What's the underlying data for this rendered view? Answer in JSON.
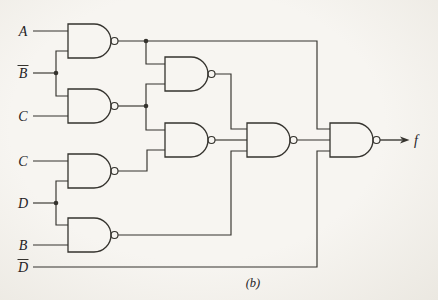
{
  "circuit": {
    "description": "Seven-input NAND-gate logic network realizing output f",
    "caption": {
      "text": "(b)",
      "x": 253,
      "y": 287
    },
    "output": {
      "label": "f",
      "label_x": 414,
      "label_y": 144.5
    },
    "style": {
      "background": "#f5f3ef",
      "line_color": "#35332e",
      "text_color": "#24221f",
      "line_width": 1.15
    },
    "inputs": [
      {
        "label": "A",
        "bar": false,
        "y": 31
      },
      {
        "label": "B",
        "bar": true,
        "y": 73
      },
      {
        "label": "C",
        "bar": false,
        "y": 116
      },
      {
        "label": "C",
        "bar": false,
        "y": 161
      },
      {
        "label": "D",
        "bar": false,
        "y": 203
      },
      {
        "label": "B",
        "bar": false,
        "y": 245
      },
      {
        "label": "D",
        "bar": true,
        "y": 267
      }
    ],
    "gates": [
      {
        "name": "nand-gate-1",
        "type": "NAND-2",
        "x": 68,
        "cy": 41,
        "sources": [
          "A",
          "B-bar"
        ]
      },
      {
        "name": "nand-gate-2",
        "type": "NAND-2",
        "x": 68,
        "cy": 106,
        "sources": [
          "B-bar",
          "C"
        ]
      },
      {
        "name": "nand-gate-3",
        "type": "NAND-2",
        "x": 68,
        "cy": 171,
        "sources": [
          "C",
          "D"
        ]
      },
      {
        "name": "nand-gate-4",
        "type": "NAND-2",
        "x": 68,
        "cy": 235,
        "sources": [
          "D",
          "B"
        ]
      },
      {
        "name": "nand-gate-5",
        "type": "NAND-2",
        "x": 165,
        "cy": 74,
        "sources": [
          "gate-1-out",
          "gate-2-out"
        ]
      },
      {
        "name": "nand-gate-6",
        "type": "NAND-2",
        "x": 165,
        "cy": 140,
        "sources": [
          "gate-2-out",
          "gate-3-out"
        ]
      },
      {
        "name": "nand-gate-7",
        "type": "NAND-3",
        "x": 247,
        "cy": 140,
        "sources": [
          "gate-5-out",
          "gate-6-out",
          "gate-4-out"
        ]
      },
      {
        "name": "nand-gate-8",
        "type": "NAND-3",
        "x": 330,
        "cy": 140,
        "sources": [
          "gate-1-out",
          "gate-7-out",
          "D-bar"
        ],
        "drives": "f"
      }
    ],
    "wires": [
      {
        "name": "input-a",
        "pts": [
          [
            33,
            31
          ],
          [
            68,
            31
          ]
        ]
      },
      {
        "name": "input-bbar-stem",
        "pts": [
          [
            33,
            73
          ],
          [
            56,
            73
          ]
        ]
      },
      {
        "name": "input-bbar-fork",
        "pts": [
          [
            68,
            51
          ],
          [
            56,
            51
          ],
          [
            56,
            96
          ],
          [
            68,
            96
          ]
        ]
      },
      {
        "name": "input-c1",
        "pts": [
          [
            33,
            116
          ],
          [
            68,
            116
          ]
        ]
      },
      {
        "name": "input-c2",
        "pts": [
          [
            33,
            161
          ],
          [
            68,
            161
          ]
        ]
      },
      {
        "name": "input-d-stem",
        "pts": [
          [
            33,
            203
          ],
          [
            56,
            203
          ]
        ]
      },
      {
        "name": "input-d-fork",
        "pts": [
          [
            68,
            181
          ],
          [
            56,
            181
          ],
          [
            56,
            225
          ],
          [
            68,
            225
          ]
        ]
      },
      {
        "name": "input-b",
        "pts": [
          [
            33,
            245
          ],
          [
            68,
            245
          ]
        ]
      },
      {
        "name": "input-dbar",
        "pts": [
          [
            33,
            267
          ],
          [
            317,
            267
          ],
          [
            317,
            151
          ],
          [
            330,
            151
          ]
        ]
      },
      {
        "name": "gate1-out",
        "pts": [
          [
            118,
            41
          ],
          [
            317,
            41
          ],
          [
            317,
            129
          ],
          [
            330,
            129
          ]
        ]
      },
      {
        "name": "gate1-to-gate5",
        "pts": [
          [
            146,
            41
          ],
          [
            146,
            64
          ],
          [
            165,
            64
          ]
        ]
      },
      {
        "name": "gate2-out",
        "pts": [
          [
            118,
            106
          ],
          [
            146,
            106
          ]
        ]
      },
      {
        "name": "gate2-to-gate5",
        "pts": [
          [
            146,
            106
          ],
          [
            146,
            84
          ],
          [
            165,
            84
          ]
        ]
      },
      {
        "name": "gate2-to-gate6",
        "pts": [
          [
            146,
            106
          ],
          [
            146,
            130
          ],
          [
            165,
            130
          ]
        ]
      },
      {
        "name": "gate3-out",
        "pts": [
          [
            118,
            171
          ],
          [
            147,
            171
          ],
          [
            147,
            150
          ],
          [
            165,
            150
          ]
        ]
      },
      {
        "name": "gate4-out",
        "pts": [
          [
            118,
            235
          ],
          [
            231,
            235
          ],
          [
            231,
            151
          ],
          [
            247,
            151
          ]
        ]
      },
      {
        "name": "gate5-out",
        "pts": [
          [
            215,
            74
          ],
          [
            231,
            74
          ],
          [
            231,
            129
          ],
          [
            247,
            129
          ]
        ]
      },
      {
        "name": "gate6-out",
        "pts": [
          [
            215,
            140
          ],
          [
            247,
            140
          ]
        ]
      },
      {
        "name": "gate7-out",
        "pts": [
          [
            297,
            140
          ],
          [
            330,
            140
          ]
        ]
      }
    ],
    "junctions": [
      [
        56,
        73
      ],
      [
        56,
        203
      ],
      [
        146,
        41
      ],
      [
        146,
        106
      ]
    ],
    "output_arrow": {
      "line": [
        [
          380,
          140
        ],
        [
          402,
          140
        ]
      ],
      "tip": [
        409.5,
        140
      ]
    }
  }
}
